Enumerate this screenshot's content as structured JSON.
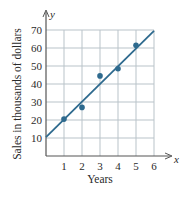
{
  "chart_data": {
    "type": "scatter",
    "title": "",
    "xlabel": "Years",
    "ylabel": "Sales in thousands of dollars",
    "x_axis_symbol": "x",
    "y_axis_symbol": "y",
    "xlim": [
      0,
      6
    ],
    "ylim": [
      0,
      70
    ],
    "x_ticks": [
      1,
      2,
      3,
      4,
      5,
      6
    ],
    "y_ticks": [
      10,
      20,
      30,
      40,
      50,
      60,
      70
    ],
    "grid": true,
    "series": [
      {
        "name": "Sales data",
        "kind": "scatter",
        "x": [
          1,
          2,
          3,
          4,
          5
        ],
        "y": [
          20.5,
          27,
          44.5,
          48.5,
          61.5
        ]
      },
      {
        "name": "Best-fit line",
        "kind": "line",
        "x": [
          0,
          6
        ],
        "y": [
          10.5,
          69.5
        ]
      }
    ],
    "colors": {
      "points": "#2e6a8e",
      "line": "#2e6a8e",
      "grid": "#b9c3c9",
      "axes": "#555555"
    }
  }
}
